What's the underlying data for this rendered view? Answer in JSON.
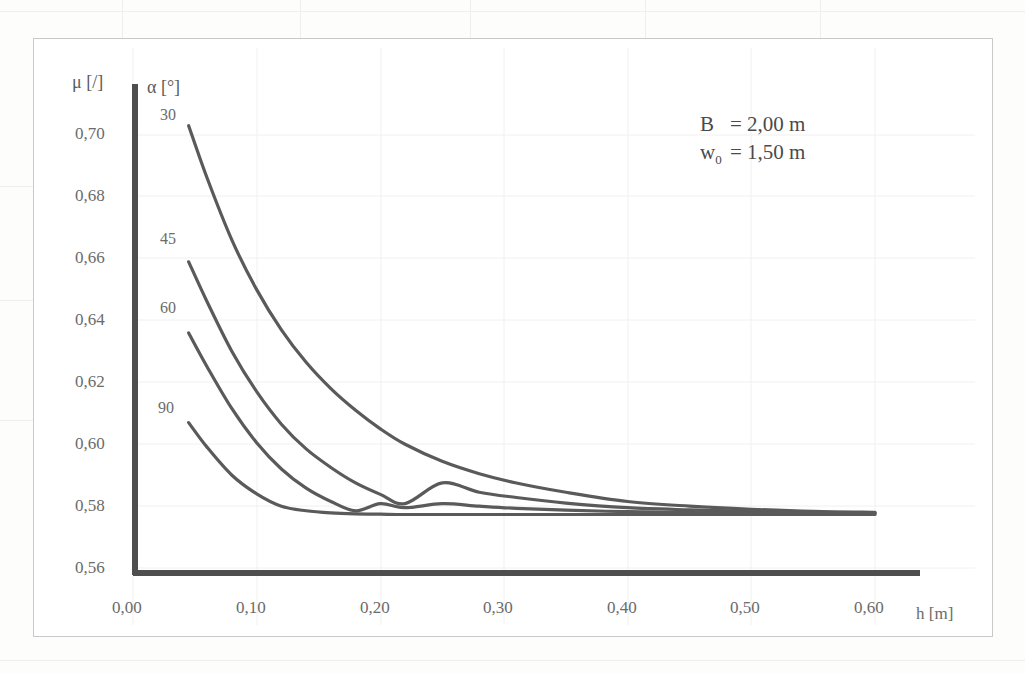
{
  "figure": {
    "y_axis_title": "μ  [/]",
    "x_axis_title": "h [m]",
    "legend_title": "α [°]",
    "annotation": {
      "line1_symbol": "B",
      "line1_value": "= 2,00 m",
      "line2_symbol": "w",
      "line2_sub": "0",
      "line2_value": "= 1,50 m"
    },
    "curve_labels": [
      "30",
      "45",
      "60",
      "90"
    ],
    "y_ticks": [
      "0,56",
      "0,58",
      "0,60",
      "0,62",
      "0,64",
      "0,66",
      "0,68",
      "0,70"
    ],
    "x_ticks": [
      "0,00",
      "0,10",
      "0,20",
      "0,30",
      "0,40",
      "0,50",
      "0,60"
    ],
    "colors": {
      "curve": "#5a5a5a",
      "axis": "#4a4a4a",
      "grid": "#f2f1f0",
      "text": "#6b6b6b",
      "frame": "#c9c9c9"
    }
  },
  "chart_data": {
    "type": "line",
    "title": "",
    "subtitle": "",
    "xlabel": "h [m]",
    "ylabel": "μ [/]",
    "xlim": [
      0.0,
      0.65
    ],
    "ylim": [
      0.56,
      0.713
    ],
    "xticks": [
      0.0,
      0.1,
      0.2,
      0.3,
      0.4,
      0.5,
      0.6
    ],
    "yticks": [
      0.56,
      0.58,
      0.6,
      0.62,
      0.64,
      0.66,
      0.68,
      0.7
    ],
    "xtick_labels": [
      "0,00",
      "0,10",
      "0,20",
      "0,30",
      "0,40",
      "0,50",
      "0,60"
    ],
    "ytick_labels": [
      "0,56",
      "0,58",
      "0,60",
      "0,62",
      "0,64",
      "0,66",
      "0,68",
      "0,70"
    ],
    "grid": true,
    "legend_position": "inside-upper-left",
    "legend_title": "α [°]",
    "annotations": [
      "B  = 2,00 m",
      "w0 = 1,50 m"
    ],
    "x": [
      0.045,
      0.06,
      0.08,
      0.1,
      0.12,
      0.14,
      0.16,
      0.18,
      0.2,
      0.22,
      0.25,
      0.28,
      0.31,
      0.35,
      0.4,
      0.45,
      0.5,
      0.55,
      0.6
    ],
    "series": [
      {
        "name": "30",
        "label": "α = 30°",
        "values": [
          0.703,
          0.686,
          0.666,
          0.65,
          0.637,
          0.6265,
          0.618,
          0.611,
          0.605,
          0.6,
          0.5945,
          0.5905,
          0.5875,
          0.5845,
          0.5815,
          0.58,
          0.579,
          0.5783,
          0.578
        ]
      },
      {
        "name": "45",
        "label": "α = 45°",
        "values": [
          0.659,
          0.646,
          0.63,
          0.617,
          0.6065,
          0.5985,
          0.5925,
          0.5875,
          0.5838,
          0.5808,
          0.5875,
          0.5845,
          0.5828,
          0.581,
          0.5795,
          0.5788,
          0.5783,
          0.578,
          0.5778
        ]
      },
      {
        "name": "60",
        "label": "α = 60°",
        "values": [
          0.636,
          0.625,
          0.6115,
          0.6005,
          0.592,
          0.5858,
          0.5815,
          0.5785,
          0.5808,
          0.5795,
          0.5808,
          0.58,
          0.5793,
          0.5787,
          0.5782,
          0.5779,
          0.5778,
          0.5777,
          0.5776
        ]
      },
      {
        "name": "90",
        "label": "α = 90°",
        "values": [
          0.607,
          0.599,
          0.59,
          0.584,
          0.58,
          0.5785,
          0.5778,
          0.5775,
          0.5774,
          0.5773,
          0.5773,
          0.5773,
          0.5773,
          0.5773,
          0.5773,
          0.5773,
          0.5773,
          0.5773,
          0.5773
        ]
      }
    ]
  }
}
